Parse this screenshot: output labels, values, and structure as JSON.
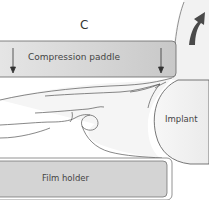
{
  "diagram": {
    "panel_label": "C",
    "labels": {
      "compression_paddle": "Compression paddle",
      "implant": "Implant",
      "film_holder": "Film holder"
    },
    "colors": {
      "paddle_fill": "#d6d6d6",
      "film_holder_fill": "#d4d4d4",
      "implant_fill": "#f1f1f1",
      "arrow_fill": "#4a4a4a",
      "outline": "#555555"
    }
  }
}
